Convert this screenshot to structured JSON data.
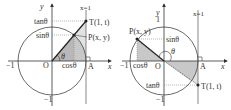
{
  "colors": {
    "line": "#333333",
    "circle": "#444444",
    "shade_dark": "#bdbdbd",
    "shade_light": "#dedede",
    "dotted": "#888888",
    "background": "#ffffff"
  },
  "left": {
    "axis_x_label": "x",
    "axis_y_label": "y",
    "line_label": "x=1",
    "origin_label": "O",
    "point_A_label": "A",
    "point_T_label": "T(1, t)",
    "point_P_label": "P(x, y)",
    "neg_one_x": "−1",
    "neg_one_y": "−1",
    "tan_label": "tanθ",
    "sin_label": "sinθ",
    "cos_label": "cosθ",
    "angle_label": "θ"
  },
  "right": {
    "axis_x_label": "x",
    "axis_y_label": "y",
    "line_label": "x=1",
    "origin_label": "O",
    "point_A_label": "A",
    "point_T_label": "T(1, t)",
    "point_P_label": "P(x, y)",
    "neg_one_x": "−1",
    "neg_one_y": "−1",
    "one_y": "1",
    "tan_label": "tanθ",
    "sin_label": "sinθ",
    "cos_label": "cosθ",
    "angle_label": "θ"
  }
}
